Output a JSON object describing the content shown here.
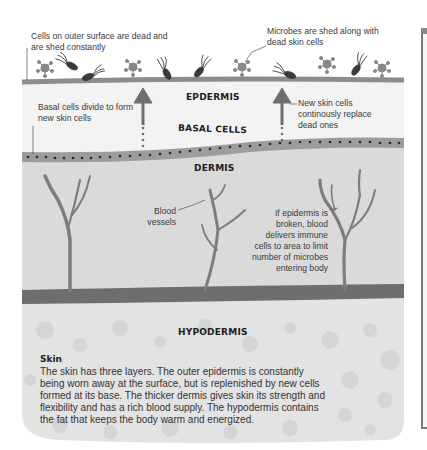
{
  "diagram": {
    "title": "Skin",
    "layers": {
      "epidermis": "EPDERMIS",
      "basal": "BASAL CELLS",
      "dermis": "DERMIS",
      "hypodermis": "HYPODERMIS"
    },
    "annotations": {
      "dead_cells": "Cells on outer surface are dead and are shed constantly",
      "microbes": "Microbes are shed along with dead skin cells",
      "basal_divide": "Basal cells divide to form new skin cells",
      "new_cells": "New skin cells continously replace dead ones",
      "blood_vessels": "Blood vessels",
      "immune": "If epidermis is broken, blood delivers immune cells to area to limit number of microbes entering body"
    },
    "caption": {
      "heading": "Skin",
      "body": "The skin has three layers. The outer epidermis is constantly being worn away at the surface, but is replenished by new cells formed at its base. The thicker dermis gives skin its strength and flexibility and has a rich blood supply. The hypodermis contains the fat that keeps the body warm and energized."
    },
    "colors": {
      "surface_line": "#8c8c8c",
      "epidermis_fill": "#f2f2f2",
      "basal_band": "#9a9a9a",
      "dermis_fill": "#dcdcdc",
      "vessel": "#7d7d7d",
      "hypodermis_band": "#6e6e6e",
      "hypodermis_fill": "#e2e2e2"
    }
  }
}
